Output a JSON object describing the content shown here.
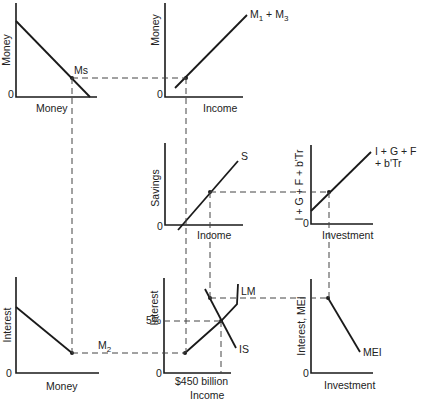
{
  "diagram": {
    "title": "",
    "panels": {
      "money_supply": {
        "y_label": "Money",
        "x_label": "Money",
        "origin": "0",
        "curve_label": "Ms"
      },
      "transactions_demand": {
        "y_label": "Money",
        "x_label": "Income",
        "origin": "0",
        "curve_label_main": "M",
        "curve_label_sub1": "1",
        "curve_label_plus": " + M",
        "curve_label_sub3": "3"
      },
      "savings": {
        "y_label": "Savings",
        "x_label": "Income",
        "origin": "0",
        "curve_label": "S"
      },
      "injections": {
        "y_label": "I + G + F + b'Tr",
        "x_label": "Investment",
        "origin": "0",
        "curve_label_line1": "I + G + F",
        "curve_label_line2": "+ b'Tr"
      },
      "liquidity_preference": {
        "y_label": "Interest",
        "x_label": "Money",
        "origin": "0",
        "curve_label_main": "M",
        "curve_label_sub": "2"
      },
      "is_lm": {
        "y_label": "Interest",
        "x_label": "Income",
        "x_tick": "$450 billion",
        "y_tick": "5%",
        "origin": "0",
        "lm_label": "LM",
        "is_label": "IS"
      },
      "mei": {
        "y_label": "Interest, MEI",
        "x_label": "Investment",
        "origin": "0",
        "curve_label": "MEI"
      }
    }
  }
}
